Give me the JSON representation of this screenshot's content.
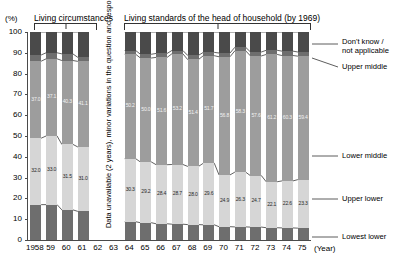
{
  "header": {
    "pct_label": "(%)",
    "group_left": "Living circumstances",
    "group_right": "Living standards of the head of household  (by 1969)"
  },
  "axis": {
    "y_ticks": [
      "100",
      "90",
      "80",
      "70",
      "60",
      "50",
      "40",
      "30",
      "20",
      "10",
      "0"
    ],
    "x_unit": "(Year)",
    "x_labels": [
      "1958",
      "59",
      "60",
      "61",
      "62",
      "63",
      "64",
      "65",
      "66",
      "67",
      "68",
      "69",
      "70",
      "71",
      "72",
      "73",
      "74",
      "75"
    ]
  },
  "gap_note": "Data unavailable (2 years), minor variations in the question and response",
  "legend": {
    "dont_know": "Don't know /\nnot applicable",
    "dont_know_l1": "Don't know /",
    "dont_know_l2": "not applicable",
    "upper_middle": "Upper middle",
    "lower_middle": "Lower middle",
    "upper_lower": "Upper lower",
    "lowest_lower": "Lowest lower"
  },
  "colors": {
    "dont_know": "#4a4a4a",
    "upper_middle": "#6e6e6e",
    "lower_middle": "#9d9d9d",
    "upper_lower": "#d6d6d6",
    "lowest_lower": "#6e6e6e",
    "axis": "#4a4a4a"
  },
  "chart_data": {
    "type": "bar",
    "stacked": true,
    "xlabel": "(Year)",
    "ylabel": "(%)",
    "ylim": [
      0,
      100
    ],
    "grid": false,
    "legend_position": "right",
    "categories": [
      "1958",
      "59",
      "60",
      "61",
      "62",
      "63",
      "64",
      "65",
      "66",
      "67",
      "68",
      "69",
      "70",
      "71",
      "72",
      "73",
      "74",
      "75"
    ],
    "missing_categories": [
      "62",
      "63"
    ],
    "series": [
      {
        "name": "Lowest lower",
        "values": [
          17.0,
          17.0,
          14.5,
          13.8,
          null,
          null,
          8.8,
          8.3,
          7.8,
          7.6,
          7.4,
          7.3,
          6.4,
          6.3,
          6.2,
          5.9,
          5.8,
          5.7
        ]
      },
      {
        "name": "Upper lower",
        "values": [
          32.0,
          33.0,
          31.5,
          31.0,
          null,
          null,
          30.3,
          29.2,
          28.4,
          28.7,
          28.0,
          29.6,
          24.9,
          26.3,
          24.7,
          22.1,
          22.6,
          23.3
        ]
      },
      {
        "name": "Lower middle",
        "values": [
          37.0,
          37.1,
          40.3,
          41.1,
          null,
          null,
          50.2,
          50.0,
          51.6,
          53.2,
          51.4,
          51.7,
          56.8,
          58.3,
          57.6,
          61.2,
          60.3,
          59.4
        ]
      },
      {
        "name": "Upper middle",
        "values": [
          3.0,
          2.9,
          3.2,
          2.0,
          null,
          null,
          1.8,
          1.8,
          1.9,
          1.6,
          2.0,
          1.6,
          1.8,
          1.7,
          1.9,
          2.0,
          2.1,
          2.0
        ]
      },
      {
        "name": "Don't know / not applicable",
        "values": [
          11.0,
          10.0,
          10.5,
          12.1,
          null,
          null,
          8.9,
          10.7,
          10.3,
          8.9,
          11.2,
          9.8,
          10.1,
          7.4,
          9.6,
          8.8,
          9.2,
          9.6
        ]
      }
    ],
    "labeled_series": [
      "Lower middle",
      "Upper lower"
    ],
    "value_labels": {
      "Lower middle": [
        "37.0",
        "37.1",
        "40.3",
        "41.1",
        null,
        null,
        "50.2",
        "50.0",
        "51.6",
        "53.2",
        "51.4",
        "51.7",
        "56.8",
        "58.3",
        "57.6",
        "61.2",
        "60.3",
        "59.4"
      ],
      "Upper lower": [
        "32.0",
        "33.0",
        "31.5",
        "31.0",
        null,
        null,
        "30.3",
        "29.2",
        "28.4",
        "28.7",
        "28.0",
        "29.6",
        "24.9",
        "26.3",
        "24.7",
        "22.1",
        "22.6",
        "23.3"
      ]
    }
  }
}
